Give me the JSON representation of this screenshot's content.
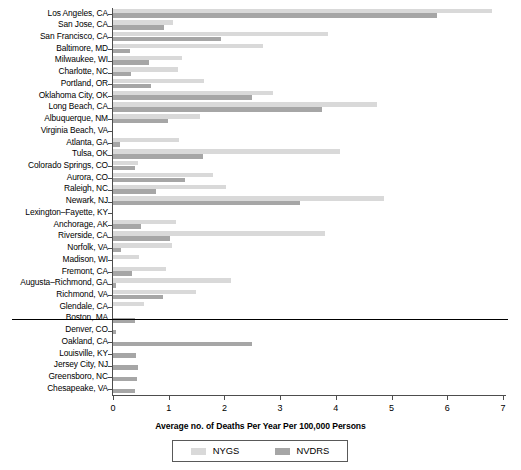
{
  "chart_data": {
    "type": "bar",
    "orientation": "horizontal",
    "title": "",
    "xlabel": "Average no. of Deaths Per Year Per 100,000 Persons",
    "ylabel": "",
    "xlim": [
      0,
      7
    ],
    "xticks": [
      0,
      1,
      2,
      3,
      4,
      5,
      6,
      7
    ],
    "xtick_labels": [
      "0",
      "1",
      "2",
      "3",
      "4",
      "5",
      "6",
      "7"
    ],
    "grid": false,
    "legend_position": "bottom-center",
    "legend": [
      "NYGS",
      "NVDRS"
    ],
    "series": [
      {
        "name": "NYGS",
        "color": "#d9d9d9"
      },
      {
        "name": "NVDRS",
        "color": "#a6a6a6"
      }
    ],
    "categories": [
      "Los Angeles, CA",
      "San Jose, CA",
      "San Francisco, CA",
      "Baltimore, MD",
      "Milwaukee, WI",
      "Charlotte, NC",
      "Portland, OR",
      "Oklahoma City, OK",
      "Long Beach, CA",
      "Albuquerque, NM",
      "Virginia Beach, VA",
      "Atlanta, GA",
      "Tulsa, OK",
      "Colorado Springs, CO",
      "Aurora, CO",
      "Raleigh, NC",
      "Newark, NJ",
      "Lexington–Fayette, KY",
      "Anchorage, AK",
      "Riverside, CA",
      "Norfolk, VA",
      "Madison, WI",
      "Fremont, CA",
      "Augusta–Richmond, GA",
      "Richmond, VA",
      "Glendale, CA",
      "Boston, MA",
      "Denver, CO",
      "Oakland, CA",
      "Louisville, KY",
      "Jersey City, NJ",
      "Greensboro, NC",
      "Chesapeake, VA"
    ],
    "rows": [
      {
        "city": "Los Angeles, CA",
        "nygs": 6.8,
        "nvdrs": 5.82
      },
      {
        "city": "San Jose, CA",
        "nygs": 1.08,
        "nvdrs": 0.91
      },
      {
        "city": "San Francisco, CA",
        "nygs": 3.86,
        "nvdrs": 1.94
      },
      {
        "city": "Baltimore, MD",
        "nygs": 2.69,
        "nvdrs": 0.3
      },
      {
        "city": "Milwaukee, WI",
        "nygs": 1.24,
        "nvdrs": 0.65
      },
      {
        "city": "Charlotte, NC",
        "nygs": 1.17,
        "nvdrs": 0.33
      },
      {
        "city": "Portland, OR",
        "nygs": 1.64,
        "nvdrs": 0.69
      },
      {
        "city": "Oklahoma City, OK",
        "nygs": 2.87,
        "nvdrs": 2.49
      },
      {
        "city": "Long Beach, CA",
        "nygs": 4.74,
        "nvdrs": 3.75
      },
      {
        "city": "Albuquerque, NM",
        "nygs": 1.56,
        "nvdrs": 0.99
      },
      {
        "city": "Virginia Beach, VA",
        "nygs": 0.0,
        "nvdrs": 0.0
      },
      {
        "city": "Atlanta, GA",
        "nygs": 1.18,
        "nvdrs": 0.13
      },
      {
        "city": "Tulsa, OK",
        "nygs": 4.07,
        "nvdrs": 1.62
      },
      {
        "city": "Colorado Springs, CO",
        "nygs": 0.45,
        "nvdrs": 0.4
      },
      {
        "city": "Aurora, CO",
        "nygs": 1.8,
        "nvdrs": 1.29
      },
      {
        "city": "Raleigh, NC",
        "nygs": 2.03,
        "nvdrs": 0.77
      },
      {
        "city": "Newark, NJ",
        "nygs": 4.86,
        "nvdrs": 3.36
      },
      {
        "city": "Lexington–Fayette, KY",
        "nygs": 0.0,
        "nvdrs": 0.0
      },
      {
        "city": "Anchorage, AK",
        "nygs": 1.13,
        "nvdrs": 0.5
      },
      {
        "city": "Riverside, CA",
        "nygs": 3.81,
        "nvdrs": 1.02
      },
      {
        "city": "Norfolk, VA",
        "nygs": 1.06,
        "nvdrs": 0.14
      },
      {
        "city": "Madison, WI",
        "nygs": 0.47,
        "nvdrs": 0.0
      },
      {
        "city": "Fremont, CA",
        "nygs": 0.95,
        "nvdrs": 0.34
      },
      {
        "city": "Augusta–Richmond, GA",
        "nygs": 2.12,
        "nvdrs": 0.05
      },
      {
        "city": "Richmond, VA",
        "nygs": 1.49,
        "nvdrs": 0.89
      },
      {
        "city": "Glendale, CA",
        "nygs": 0.55,
        "nvdrs": 0.0
      },
      {
        "city": "Boston, MA",
        "nygs": 0.0,
        "nvdrs": 0.4
      },
      {
        "city": "Denver, CO",
        "nygs": 0.0,
        "nvdrs": 0.06
      },
      {
        "city": "Oakland, CA",
        "nygs": 0.0,
        "nvdrs": 2.5
      },
      {
        "city": "Louisville, KY",
        "nygs": 0.0,
        "nvdrs": 0.41
      },
      {
        "city": "Jersey City, NJ",
        "nygs": 0.0,
        "nvdrs": 0.45
      },
      {
        "city": "Greensboro, NC",
        "nygs": 0.0,
        "nvdrs": 0.43
      },
      {
        "city": "Chesapeake, VA",
        "nygs": 0.0,
        "nvdrs": 0.4
      }
    ],
    "separator_after_category": "Glendale, CA"
  }
}
